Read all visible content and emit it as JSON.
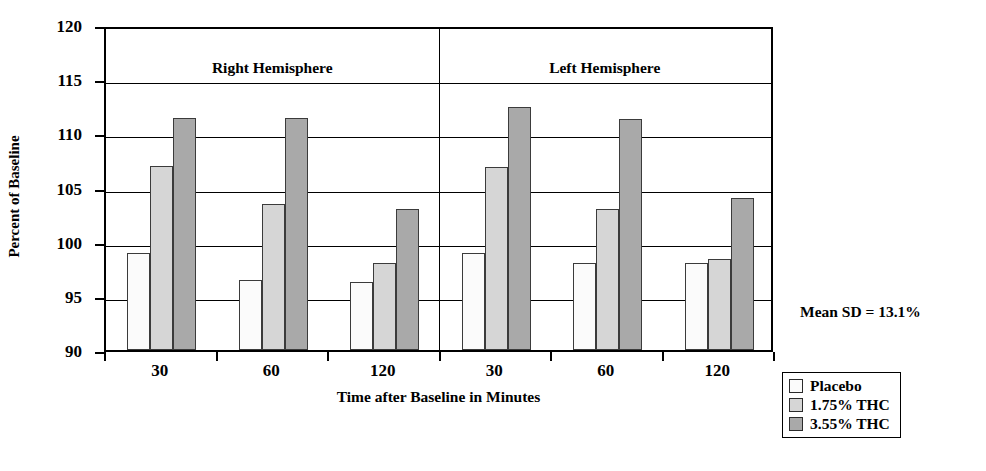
{
  "chart_data": {
    "type": "bar",
    "title": "",
    "subtitle": "",
    "xlabel": "Time after Baseline in Minutes",
    "ylabel": "Percent of Baseline",
    "ylim": [
      90,
      120
    ],
    "yticks": [
      120,
      115,
      110,
      105,
      100,
      95,
      90
    ],
    "grid": true,
    "legend_position": "bottom-right-outside",
    "panels": [
      {
        "name": "Right Hemisphere",
        "categories": [
          "30",
          "60",
          "120"
        ],
        "series": [
          {
            "name": "Placebo",
            "color": "#fbfbfb",
            "values": [
              99.0,
              96.5,
              96.3
            ]
          },
          {
            "name": "1.75% THC",
            "color": "#d6d6d6",
            "values": [
              107.0,
              103.5,
              98.0
            ]
          },
          {
            "name": "3.55% THC",
            "color": "#a9a9a9",
            "values": [
              111.4,
              111.4,
              103.0
            ]
          }
        ]
      },
      {
        "name": "Left Hemisphere",
        "categories": [
          "30",
          "60",
          "120"
        ],
        "series": [
          {
            "name": "Placebo",
            "color": "#fbfbfb",
            "values": [
              99.0,
              98.0,
              98.0
            ]
          },
          {
            "name": "1.75% THC",
            "color": "#d6d6d6",
            "values": [
              106.9,
              103.0,
              98.4
            ]
          },
          {
            "name": "3.55% THC",
            "color": "#a9a9a9",
            "values": [
              112.4,
              111.3,
              104.0
            ]
          }
        ]
      }
    ],
    "annotations": [
      "Mean  SD = 13.1%"
    ],
    "legend_entries": [
      "Placebo",
      "1.75% THC",
      "3.55% THC"
    ]
  },
  "axis": {
    "ylabel": "Percent of Baseline",
    "xlabel": "Time after Baseline in Minutes",
    "yticks": [
      "120",
      "115",
      "110",
      "105",
      "100",
      "95",
      "90"
    ],
    "xticks": [
      "30",
      "60",
      "120",
      "30",
      "60",
      "120"
    ]
  },
  "panels": {
    "right_title": "Right Hemisphere",
    "left_title": "Left Hemisphere"
  },
  "annotation": {
    "text": "Mean  SD = 13.1%"
  },
  "legend": {
    "items": [
      {
        "label": "Placebo"
      },
      {
        "label": "1.75% THC"
      },
      {
        "label": "3.55% THC"
      }
    ]
  },
  "colors": {
    "placebo": "#fbfbfb",
    "thc175": "#d6d6d6",
    "thc355": "#a9a9a9",
    "axis": "#000000"
  }
}
